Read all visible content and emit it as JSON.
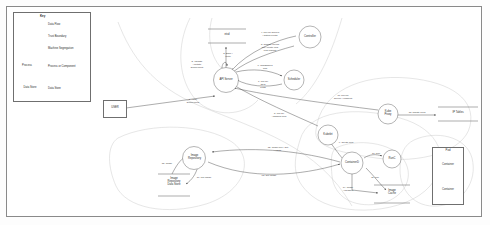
{
  "diagram": {
    "type": "data-flow-diagram"
  },
  "legend": {
    "title": "Key",
    "items": [
      {
        "key": "data-flow",
        "label": "Data Flow"
      },
      {
        "key": "trust-boundary",
        "label": "Trust Boundary"
      },
      {
        "key": "machine-segregation",
        "label": "Machine Segregation"
      },
      {
        "key": "process",
        "label": "Process or Component",
        "glyph": "Process"
      },
      {
        "key": "data-store",
        "label": "Data Store",
        "glyph": "Data Store"
      }
    ]
  },
  "nodes": {
    "user": {
      "label": "USER",
      "shape": "external-entity"
    },
    "etcd": {
      "label": "etcd",
      "shape": "data-store"
    },
    "api_server": {
      "label": "API Server",
      "shape": "process"
    },
    "controller": {
      "label": "Controller",
      "shape": "process"
    },
    "scheduler": {
      "label": "Scheduler",
      "shape": "process"
    },
    "kube_proxy": {
      "label": "Kube\nProxy",
      "shape": "process"
    },
    "ip_tables": {
      "label": "IP Tables",
      "shape": "data-store"
    },
    "kubelet": {
      "label": "Kubelet",
      "shape": "process"
    },
    "containerd": {
      "label": "ContainerD",
      "shape": "process"
    },
    "runc": {
      "label": "RunC",
      "shape": "process"
    },
    "image_cache": {
      "label": "Image\nCache",
      "shape": "data-store"
    },
    "image_repository": {
      "label": "Image\nRepository",
      "shape": "process"
    },
    "image_repo_store": {
      "label": "Image\nRepository\nData Store",
      "shape": "data-store"
    },
    "pod": {
      "label": "Pod",
      "shape": "container-box"
    },
    "container_1": {
      "label": "Container",
      "shape": "process"
    },
    "container_2": {
      "label": "Container",
      "shape": "process"
    }
  },
  "flows": [
    {
      "id": "f1",
      "label": "1. Apply\nDeployment",
      "from": "user",
      "to": "api_server"
    },
    {
      "id": "f2",
      "label": "2. Validate\n/ Mutate\nDeployment",
      "from": "api_server",
      "to": "api_server"
    },
    {
      "id": "f3",
      "label": "3. Store /\nWrite",
      "from": "api_server",
      "to": "etcd"
    },
    {
      "id": "f4",
      "label": "4. Poll for queries\n/ watch events",
      "from": "controller",
      "to": "api_server"
    },
    {
      "id": "f5",
      "label": "5. Change replica\nset / create new\npod request",
      "from": "controller",
      "to": "api_server"
    },
    {
      "id": "f6",
      "label": "6. Unassigned\nPod",
      "from": "api_server",
      "to": "scheduler"
    },
    {
      "id": "f7",
      "label": "7. Poll for\nNew\nPods",
      "from": "scheduler",
      "to": "api_server"
    },
    {
      "id": "f8",
      "label": "8. Poll for\nAssigned Pod",
      "from": "kubelet",
      "to": "api_server"
    },
    {
      "id": "f9",
      "label": "9. Create Pod",
      "from": "kubelet",
      "to": "containerd"
    },
    {
      "id": "f10",
      "label": "10. Run",
      "from": "containerd",
      "to": "runc"
    },
    {
      "id": "f11",
      "label": "11. Pull",
      "from": "containerd",
      "to": "image_cache"
    },
    {
      "id": "f12",
      "label": "12. Image pull / Get\n/ Write",
      "from": "containerd",
      "to": "image_repository"
    },
    {
      "id": "f13",
      "label": "13. Get Image",
      "from": "image_repository",
      "to": "containerd"
    },
    {
      "id": "f14",
      "label": "14. Image\nAvailable?",
      "from": "containerd",
      "to": "image_cache"
    },
    {
      "id": "f15",
      "label": "15. Image",
      "from": "image_repo_store",
      "to": "image_repository"
    },
    {
      "id": "f16",
      "label": "16. pull image",
      "from": "image_repository",
      "to": "image_repo_store"
    },
    {
      "id": "f17",
      "label": "17. Poll for\nservice / endpoint",
      "from": "kube_proxy",
      "to": "api_server"
    },
    {
      "id": "f18",
      "label": "18. update rules",
      "from": "kube_proxy",
      "to": "ip_tables"
    }
  ]
}
